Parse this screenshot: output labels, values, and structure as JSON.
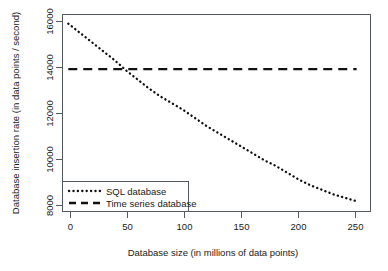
{
  "chart_data": {
    "type": "line",
    "title": "",
    "subtitle": "",
    "xlabel": "Database size (in millions of data points)",
    "ylabel": "Database insertion rate  (in data points / second)",
    "xlim": [
      -5,
      262
    ],
    "ylim": [
      7750,
      16400
    ],
    "grid": false,
    "legend_position": "bottom-left",
    "xticks": [
      0,
      50,
      100,
      150,
      200,
      250
    ],
    "xtick_labels": [
      "0",
      "50",
      "100",
      "150",
      "200",
      "250"
    ],
    "yticks": [
      8000,
      10000,
      12000,
      14000,
      16000
    ],
    "ytick_labels": [
      "8000",
      "10000",
      "12000",
      "14000",
      "16000"
    ],
    "x": [
      0,
      10,
      20,
      30,
      40,
      50,
      60,
      70,
      80,
      90,
      100,
      110,
      120,
      130,
      140,
      150,
      160,
      170,
      180,
      190,
      200,
      210,
      220,
      230,
      240,
      250
    ],
    "series": [
      {
        "name": "SQL database",
        "style": "dotted",
        "color": "#111111",
        "values": [
          16000,
          15600,
          15200,
          14800,
          14400,
          13950,
          13550,
          13150,
          12800,
          12500,
          12200,
          11850,
          11500,
          11200,
          10900,
          10600,
          10300,
          10000,
          9750,
          9450,
          9150,
          8900,
          8700,
          8500,
          8350,
          8200
        ]
      },
      {
        "name": "Time series database",
        "style": "dashed",
        "color": "#111111",
        "values": [
          14000,
          14000,
          14000,
          14000,
          14000,
          14000,
          14000,
          14000,
          14000,
          14000,
          14000,
          14000,
          14000,
          14000,
          14000,
          14000,
          14000,
          14000,
          14000,
          14000,
          14000,
          14000,
          14000,
          14000,
          14000,
          14000
        ]
      }
    ],
    "annotations": [],
    "crossover_point": {
      "x": 48,
      "y": 14000
    }
  },
  "legend": {
    "entries": [
      {
        "label": "SQL database"
      },
      {
        "label": "Time series database"
      }
    ]
  }
}
